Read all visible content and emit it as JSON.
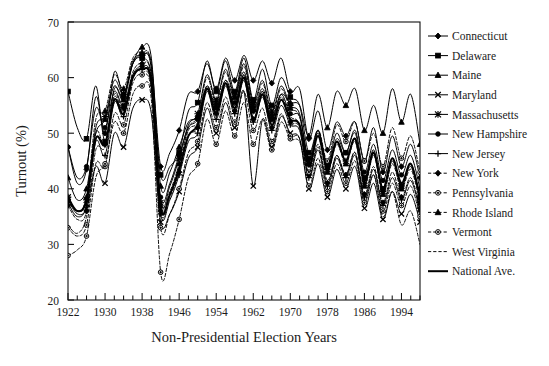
{
  "chart_data": {
    "type": "line",
    "title": "",
    "xlabel": "Non-Presidential Election Years",
    "ylabel": "Turnout (%)",
    "xlim": [
      1922,
      1998
    ],
    "ylim": [
      20,
      70
    ],
    "y_ticks": [
      20,
      30,
      40,
      50,
      60,
      70
    ],
    "x_ticks_labeled": [
      1922,
      1930,
      1938,
      1946,
      1954,
      1962,
      1970,
      1978,
      1986,
      1994
    ],
    "x_tick_interval_minor": 2,
    "grid": false,
    "legend_position": "right",
    "x": [
      1922,
      1924,
      1926,
      1928,
      1930,
      1932,
      1934,
      1936,
      1938,
      1940,
      1942,
      1944,
      1946,
      1948,
      1950,
      1952,
      1954,
      1956,
      1958,
      1960,
      1962,
      1964,
      1966,
      1968,
      1970,
      1972,
      1974,
      1976,
      1978,
      1980,
      1982,
      1984,
      1986,
      1988,
      1990,
      1992,
      1994,
      1996,
      1998
    ],
    "series": [
      {
        "name": "Connecticut",
        "marker": "diamond",
        "line": "solid",
        "values": [
          47.5,
          41.0,
          43.5,
          56.5,
          50.0,
          61.0,
          57.0,
          63.0,
          64.0,
          62.5,
          44.0,
          46.5,
          50.5,
          57.0,
          57.5,
          62.5,
          58.0,
          63.5,
          59.5,
          64.0,
          59.5,
          63.0,
          59.0,
          63.5,
          57.5,
          58.0,
          49.0,
          54.0,
          47.0,
          52.0,
          49.5,
          52.0,
          45.0,
          51.0,
          43.0,
          49.5,
          44.0,
          48.0,
          42.0
        ]
      },
      {
        "name": "Delaware",
        "marker": "square",
        "line": "solid",
        "values": [
          57.5,
          51.0,
          49.0,
          58.5,
          48.5,
          58.0,
          56.5,
          62.5,
          63.5,
          60.5,
          42.5,
          44.0,
          46.5,
          54.0,
          55.5,
          63.0,
          57.5,
          63.0,
          57.5,
          63.5,
          56.0,
          61.5,
          55.0,
          60.0,
          56.5,
          55.0,
          46.5,
          50.5,
          44.0,
          49.0,
          46.5,
          50.0,
          42.0,
          47.0,
          40.0,
          45.5,
          40.5,
          44.5,
          38.5
        ]
      },
      {
        "name": "Maine",
        "marker": "triangle",
        "line": "solid",
        "values": [
          42.0,
          38.0,
          40.0,
          50.0,
          52.5,
          58.5,
          56.0,
          62.5,
          65.5,
          63.5,
          40.5,
          43.0,
          47.5,
          52.0,
          53.0,
          58.5,
          55.0,
          59.5,
          56.5,
          61.0,
          54.5,
          58.0,
          53.0,
          57.0,
          55.5,
          55.0,
          49.5,
          57.0,
          51.0,
          57.5,
          55.0,
          58.0,
          50.5,
          55.0,
          50.0,
          58.0,
          52.0,
          57.0,
          48.0
        ]
      },
      {
        "name": "Maryland",
        "marker": "x",
        "line": "solid",
        "values": [
          38.0,
          35.5,
          36.5,
          44.0,
          41.0,
          50.0,
          47.5,
          54.5,
          56.0,
          53.5,
          34.0,
          35.5,
          39.5,
          45.5,
          47.5,
          54.5,
          50.0,
          55.5,
          51.0,
          57.5,
          40.5,
          52.5,
          47.5,
          53.0,
          50.0,
          49.0,
          40.0,
          44.5,
          38.5,
          43.5,
          40.0,
          44.0,
          36.5,
          41.0,
          34.5,
          39.5,
          35.5,
          39.0,
          34.0
        ]
      },
      {
        "name": "Massachusetts",
        "marker": "star",
        "line": "solid",
        "values": [
          38.5,
          36.0,
          38.0,
          51.0,
          53.0,
          59.5,
          57.0,
          62.5,
          64.0,
          61.5,
          37.5,
          40.5,
          45.5,
          51.5,
          53.5,
          60.5,
          56.0,
          61.5,
          57.0,
          62.5,
          55.5,
          59.5,
          54.0,
          58.5,
          55.0,
          53.5,
          45.0,
          50.0,
          43.5,
          48.5,
          45.0,
          49.0,
          41.0,
          46.5,
          39.5,
          45.0,
          40.5,
          44.0,
          38.0
        ]
      },
      {
        "name": "New Hampshire",
        "marker": "circle",
        "line": "solid",
        "values": [
          47.5,
          42.0,
          44.0,
          54.5,
          51.0,
          57.5,
          55.0,
          60.5,
          62.0,
          59.5,
          38.5,
          41.0,
          46.0,
          51.0,
          52.5,
          58.0,
          54.5,
          59.0,
          55.5,
          60.5,
          54.0,
          57.5,
          52.5,
          57.0,
          53.5,
          53.0,
          45.5,
          50.5,
          44.5,
          50.0,
          46.5,
          50.5,
          43.0,
          48.0,
          41.5,
          47.0,
          42.5,
          46.0,
          40.0
        ]
      },
      {
        "name": "New Jersey",
        "marker": "plus",
        "line": "solid",
        "values": [
          37.5,
          35.0,
          37.0,
          48.5,
          46.0,
          55.5,
          53.0,
          60.0,
          61.5,
          59.0,
          35.5,
          38.0,
          42.5,
          48.5,
          50.0,
          57.5,
          52.5,
          58.5,
          53.5,
          59.5,
          52.0,
          56.5,
          50.5,
          55.0,
          51.5,
          50.5,
          42.0,
          47.0,
          40.5,
          45.5,
          42.0,
          46.0,
          38.5,
          43.5,
          37.0,
          42.0,
          38.0,
          41.5,
          36.0
        ]
      },
      {
        "name": "New York",
        "marker": "diamond",
        "line": "dashed",
        "values": [
          37.0,
          34.5,
          36.0,
          50.0,
          48.0,
          57.0,
          54.5,
          61.0,
          62.5,
          60.0,
          36.0,
          38.5,
          43.0,
          49.5,
          51.0,
          58.0,
          53.5,
          59.0,
          54.0,
          60.0,
          52.5,
          57.0,
          51.0,
          56.0,
          52.0,
          51.0,
          42.5,
          47.5,
          41.0,
          46.0,
          42.5,
          46.5,
          39.0,
          44.0,
          37.5,
          43.0,
          38.5,
          42.0,
          36.5
        ]
      },
      {
        "name": "Pennsylvania",
        "marker": "circle-open",
        "line": "dashed",
        "values": [
          33.0,
          31.5,
          33.5,
          44.5,
          44.0,
          53.5,
          51.5,
          59.0,
          60.5,
          57.5,
          33.0,
          35.5,
          40.0,
          46.5,
          48.5,
          55.5,
          51.0,
          56.5,
          52.0,
          57.5,
          50.5,
          54.5,
          48.5,
          53.5,
          49.5,
          49.0,
          40.5,
          45.5,
          39.5,
          44.5,
          41.0,
          45.0,
          37.5,
          42.5,
          36.0,
          41.0,
          37.0,
          40.5,
          35.0
        ]
      },
      {
        "name": "Rhode Island",
        "marker": "triangle",
        "line": "dashed",
        "values": [
          38.0,
          36.0,
          38.5,
          52.5,
          54.0,
          60.5,
          58.0,
          63.5,
          64.5,
          62.0,
          37.0,
          39.5,
          44.5,
          51.0,
          53.0,
          60.0,
          55.5,
          61.0,
          56.5,
          62.0,
          55.0,
          59.0,
          53.5,
          58.0,
          54.5,
          53.0,
          44.5,
          49.5,
          43.0,
          48.0,
          44.5,
          48.5,
          40.5,
          46.0,
          39.0,
          44.5,
          40.0,
          43.5,
          37.5
        ]
      },
      {
        "name": "Vermont",
        "marker": "circle-open",
        "line": "dashed",
        "values": [
          28.0,
          29.0,
          31.5,
          42.0,
          44.5,
          52.0,
          50.0,
          57.0,
          58.5,
          56.0,
          25.0,
          28.5,
          34.5,
          42.0,
          44.5,
          52.5,
          48.0,
          54.0,
          49.5,
          55.5,
          48.0,
          52.5,
          47.0,
          52.0,
          49.0,
          48.5,
          43.0,
          50.5,
          45.0,
          51.5,
          48.5,
          52.0,
          45.0,
          50.0,
          44.0,
          51.0,
          45.5,
          49.5,
          43.0
        ]
      },
      {
        "name": "West Virginia",
        "marker": "none",
        "line": "dashed",
        "values": [
          33.5,
          32.0,
          35.0,
          47.0,
          47.5,
          56.5,
          54.0,
          60.5,
          61.0,
          58.5,
          36.5,
          39.0,
          44.0,
          50.5,
          52.0,
          58.5,
          54.0,
          59.5,
          55.0,
          60.5,
          53.5,
          57.5,
          52.0,
          56.5,
          53.0,
          51.5,
          43.0,
          48.0,
          41.5,
          46.0,
          42.5,
          46.5,
          38.0,
          42.5,
          35.0,
          39.5,
          33.5,
          36.0,
          30.0
        ]
      },
      {
        "name": "National Ave.",
        "marker": "none",
        "line": "solid-thick",
        "values": [
          38.5,
          36.0,
          38.0,
          49.0,
          48.0,
          56.0,
          53.5,
          60.0,
          61.5,
          59.0,
          36.5,
          39.0,
          43.5,
          49.5,
          51.5,
          58.0,
          53.5,
          59.0,
          54.5,
          60.0,
          52.5,
          57.0,
          51.5,
          56.0,
          52.5,
          51.5,
          44.0,
          49.5,
          43.5,
          48.5,
          45.0,
          49.0,
          41.5,
          46.5,
          40.0,
          45.5,
          41.0,
          44.5,
          38.5
        ]
      }
    ]
  }
}
